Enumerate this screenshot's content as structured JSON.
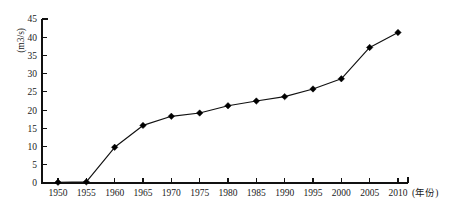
{
  "chart_data": {
    "type": "line",
    "title": "",
    "subtitle": "",
    "xlabel": "(年份)",
    "ylabel": "(m3/s)",
    "grid": false,
    "legend": null,
    "xlim": [
      1948,
      2013
    ],
    "ylim": [
      0,
      45
    ],
    "x": [
      1950,
      1955,
      1960,
      1965,
      1970,
      1975,
      1980,
      1985,
      1990,
      1995,
      2000,
      2005,
      2010
    ],
    "values": [
      0.2,
      0.3,
      9.8,
      15.8,
      18.3,
      19.2,
      21.2,
      22.5,
      23.7,
      25.8,
      28.6,
      37.2,
      41.3
    ],
    "series": [
      {
        "name": "",
        "marker": "diamond",
        "color": "#000000",
        "values": [
          0.2,
          0.3,
          9.8,
          15.8,
          18.3,
          19.2,
          21.2,
          22.5,
          23.7,
          25.8,
          28.6,
          37.2,
          41.3
        ]
      }
    ],
    "x_tick_labels": [
      "1950",
      "1955",
      "1960",
      "1965",
      "1970",
      "1975",
      "1980",
      "1985",
      "1990",
      "1995",
      "2000",
      "2005",
      "2010"
    ],
    "y_tick_labels": [
      "0",
      "5",
      "10",
      "15",
      "20",
      "25",
      "30",
      "35",
      "40",
      "45"
    ],
    "y_ticks": [
      0,
      5,
      10,
      15,
      20,
      25,
      30,
      35,
      40,
      45
    ],
    "x_ticks": [
      1950,
      1955,
      1960,
      1965,
      1970,
      1975,
      1980,
      1985,
      1990,
      1995,
      2000,
      2005,
      2010
    ]
  }
}
